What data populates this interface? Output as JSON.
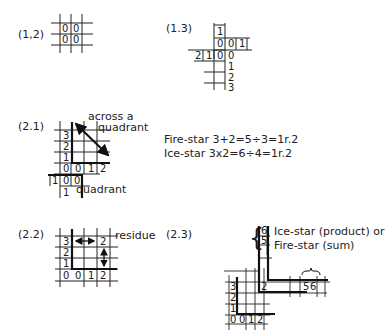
{
  "figures": {
    "f12": {
      "label": "(1,2)",
      "cells": [
        "0",
        "0",
        "0",
        "0"
      ]
    },
    "f13": {
      "label": "(1.3)",
      "top": "1",
      "row1": [
        "0",
        "0",
        "1"
      ],
      "row2": [
        "2",
        "1",
        "0",
        "0"
      ],
      "col": [
        "1",
        "2",
        "3"
      ]
    },
    "f21": {
      "label": "(2.1)",
      "annotation_across": "across a",
      "annotation_quadrant_top": "quadrant",
      "annotation_quadrant_bottom": "quadrant",
      "col": [
        "3",
        "2",
        "1"
      ],
      "row0": [
        "0",
        "0",
        "1",
        "2"
      ],
      "row_neg": [
        "1",
        "0",
        "0"
      ],
      "bottom": "1"
    },
    "formulas": {
      "fire": "Fire-star  3+2=5÷3=1r.2",
      "ice": "Ice-star  3x2=6÷4=1r.2"
    },
    "f22": {
      "label": "(2.2)",
      "col": [
        "3",
        "2",
        "1"
      ],
      "row0": [
        "0",
        "0",
        "1",
        "2"
      ],
      "top_right": "2",
      "annotation": "residue"
    },
    "f23": {
      "label": "(2.3)",
      "top_cells": [
        "6",
        "5"
      ],
      "annotation_line1": "Ice-star (product) or",
      "annotation_line2": "Fire-star (sum)",
      "mid_cell": "2",
      "right_cells": [
        "5",
        "6"
      ],
      "col": [
        "3",
        "2",
        "1"
      ],
      "row0": [
        "0",
        "0",
        "1",
        "2"
      ]
    }
  }
}
